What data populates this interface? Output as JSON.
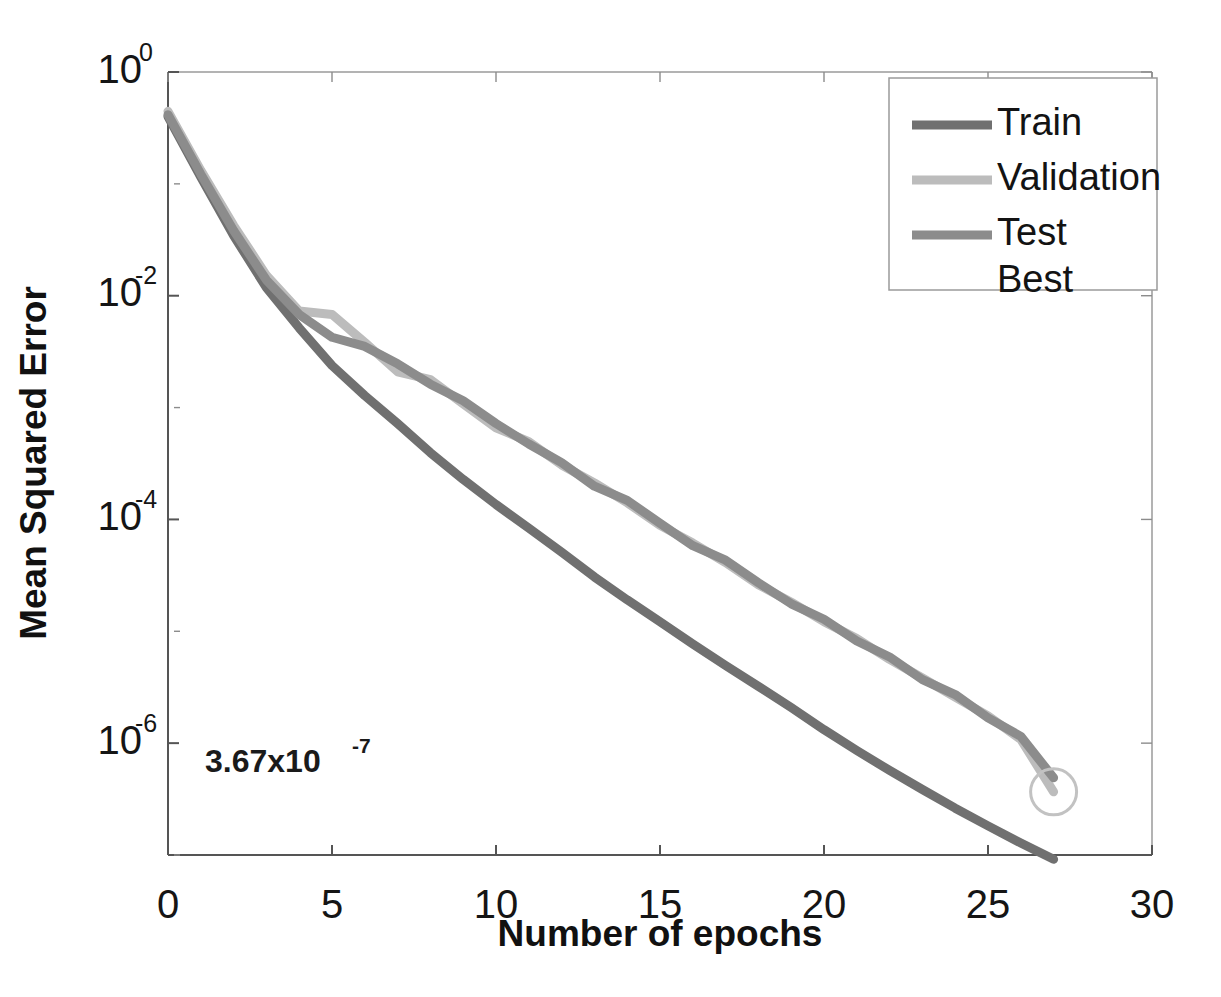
{
  "chart_data": {
    "type": "line",
    "title": "",
    "subtitle": "",
    "xlabel": "Number of epochs",
    "ylabel": "Mean Squared Error",
    "xlim": [
      0,
      30
    ],
    "ylim": [
      1e-07,
      1
    ],
    "yscale": "log",
    "xticks": [
      "0",
      "5",
      "10",
      "15",
      "20",
      "25",
      "30"
    ],
    "xtick_values": [
      0,
      5,
      10,
      15,
      20,
      25,
      30
    ],
    "yticks": [
      "10^0",
      "10^-2",
      "10^-4",
      "10^-6"
    ],
    "ytick_mantissa": [
      "10",
      "10",
      "10",
      "10"
    ],
    "ytick_exponent": [
      "0",
      "-2",
      "-4",
      "-6"
    ],
    "ytick_values": [
      1,
      0.01,
      0.0001,
      1e-06
    ],
    "grid": false,
    "legend_position": "top-right",
    "annotation": {
      "mantissa": "3.67x10",
      "exponent": "-7",
      "full_text": "3.67x10-7"
    },
    "best_epoch": 27,
    "best_value": 3.67e-07,
    "x": [
      0,
      1,
      2,
      3,
      4,
      5,
      6,
      7,
      8,
      9,
      10,
      11,
      12,
      13,
      14,
      15,
      16,
      17,
      18,
      19,
      20,
      21,
      22,
      23,
      24,
      25,
      26,
      27
    ],
    "series": [
      {
        "name": "Train",
        "color": "#707070",
        "values": [
          0.4,
          0.115,
          0.0345,
          0.0118,
          0.00515,
          0.00238,
          0.00128,
          0.00072,
          0.000395,
          0.000228,
          0.000136,
          8.36e-05,
          5.11e-05,
          3.06e-05,
          1.91e-05,
          1.22e-05,
          7.7e-06,
          4.95e-06,
          3.22e-06,
          2.08e-06,
          1.32e-06,
          8.6e-07,
          5.7e-07,
          3.85e-07,
          2.62e-07,
          1.82e-07,
          1.28e-07,
          9.15e-08
        ]
      },
      {
        "name": "Validation",
        "color": "#bcbcbc",
        "values": [
          0.445,
          0.132,
          0.0425,
          0.0152,
          0.0073,
          0.0068,
          0.00382,
          0.00209,
          0.00178,
          0.00108,
          0.00066,
          0.000495,
          0.000307,
          0.000212,
          0.000141,
          8.85e-05,
          6.15e-05,
          4.12e-05,
          2.61e-05,
          1.82e-05,
          1.22e-05,
          8.6e-06,
          5.6e-06,
          3.82e-06,
          2.58e-06,
          1.75e-06,
          1.08e-06,
          3.67e-07
        ]
      },
      {
        "name": "Test",
        "color": "#8c8c8c",
        "values": [
          0.415,
          0.122,
          0.0382,
          0.0138,
          0.0068,
          0.00425,
          0.00352,
          0.00246,
          0.00162,
          0.00115,
          0.00072,
          0.000472,
          0.000322,
          0.000198,
          0.000148,
          9.25e-05,
          5.82e-05,
          4.32e-05,
          2.72e-05,
          1.76e-05,
          1.28e-05,
          8.2e-06,
          5.9e-06,
          3.7e-06,
          2.72e-06,
          1.68e-06,
          1.15e-06,
          4.9e-07
        ]
      }
    ],
    "legend_entries": [
      {
        "label": "Train",
        "color": "#707070",
        "has_line": true
      },
      {
        "label": "Validation",
        "color": "#bcbcbc",
        "has_line": true
      },
      {
        "label": "Test",
        "color": "#8c8c8c",
        "has_line": true
      },
      {
        "label": "Best",
        "color": "#ffffff",
        "has_line": false
      }
    ]
  }
}
